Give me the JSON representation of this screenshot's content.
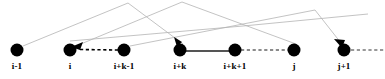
{
  "figure": {
    "kind": "sequence-node-diagram",
    "width": 385,
    "height": 79,
    "background_color": "#ffffff",
    "node_color": "#000000",
    "arc_color": "#b4b4b4",
    "edge_color": "#000000",
    "label_color": "#000000"
  },
  "nodes": [
    {
      "id": "n0",
      "label": "i-1",
      "x": 17,
      "y": 50,
      "r": 6.5
    },
    {
      "id": "n1",
      "label": "i",
      "x": 70,
      "y": 50,
      "r": 6.5
    },
    {
      "id": "n2",
      "label": "i+k-1",
      "x": 124,
      "y": 50,
      "r": 6.5
    },
    {
      "id": "n3",
      "label": "i+k",
      "x": 180,
      "y": 50,
      "r": 6.5
    },
    {
      "id": "n4",
      "label": "i+k+1",
      "x": 235,
      "y": 50,
      "r": 6.5
    },
    {
      "id": "n5",
      "label": "j",
      "x": 294,
      "y": 50,
      "r": 6.5
    },
    {
      "id": "n6",
      "label": "j+1",
      "x": 344,
      "y": 50,
      "r": 6.5
    }
  ],
  "labels_y": 66,
  "arcs": [
    {
      "name": "arc-i-minus-1-to-i-plus-k",
      "points": "23,46 128,3 183,44"
    },
    {
      "name": "arc-i-to-apex-right",
      "points": "76,46 182,2 296,44"
    },
    {
      "name": "arc-i-plus-k-minus-1-to-j-plus-1",
      "points": "130,46 315,10 344,44"
    },
    {
      "name": "arc-long-left-to-right",
      "points": "70,40 243,26 365,14"
    }
  ],
  "edges": [
    {
      "name": "edge-dashed-into-i",
      "from": "i+k-1",
      "to": "i",
      "style": "dashed",
      "arrow": true,
      "x1": 118,
      "y1": 50,
      "x2": 78,
      "y2": 50
    },
    {
      "name": "edge-solid-i-plus-k",
      "from": "i+k",
      "to": "i+k+1",
      "style": "solid",
      "arrow": false,
      "x1": 180,
      "y1": 51,
      "x2": 235,
      "y2": 51
    },
    {
      "name": "edge-dashed-i-plus-k-plus-1-to-j",
      "from": "i+k+1",
      "to": "j",
      "style": "dashed",
      "arrow": false,
      "x1": 241,
      "y1": 50,
      "x2": 290,
      "y2": 50
    },
    {
      "name": "edge-dashed-from-j-plus-1",
      "from": "j+1",
      "to": "right",
      "style": "dashed",
      "arrow": false,
      "x1": 350,
      "y1": 50,
      "x2": 385,
      "y2": 50
    }
  ],
  "arrowheads": [
    {
      "name": "arrowhead-into-i",
      "x": 76,
      "y": 47,
      "angle": 200
    },
    {
      "name": "arrowhead-into-i-plus-k",
      "x": 177,
      "y": 45,
      "angle": 212
    },
    {
      "name": "arrowhead-into-j-plus-1",
      "x": 341,
      "y": 45,
      "angle": 215
    }
  ]
}
